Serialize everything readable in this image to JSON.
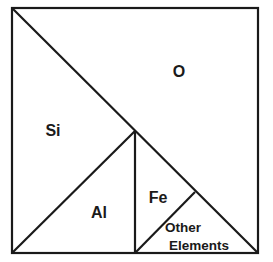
{
  "diagram": {
    "regions": [
      {
        "id": "O",
        "label": "O"
      },
      {
        "id": "Si",
        "label": "Si"
      },
      {
        "id": "Al",
        "label": "Al"
      },
      {
        "id": "Fe",
        "label": "Fe"
      },
      {
        "id": "other",
        "label_line1": "Other",
        "label_line2": "Elements"
      }
    ],
    "colors": {
      "stroke": "#1a1a1a",
      "background": "#ffffff"
    }
  }
}
